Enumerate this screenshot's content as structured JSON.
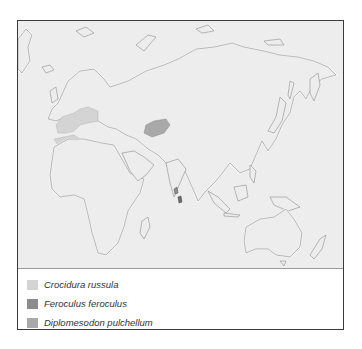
{
  "map": {
    "title": "",
    "region": "Eastern Hemisphere (Europe, Africa, Asia, Australia)",
    "ranges": [
      {
        "species": "Crocidura russula",
        "color": "#d4d4d4",
        "area": "Southwestern/central Europe, North Africa (Maghreb)"
      },
      {
        "species": "Feroculus feroculus",
        "color": "#8c8c8c",
        "area": "Sri Lanka and southern India"
      },
      {
        "species": "Diplomesodon pulchellum",
        "color": "#a9a9a9",
        "area": "Central Asian steppes/deserts east of the Caspian Sea"
      }
    ]
  },
  "legend": {
    "items": [
      {
        "label": "Crocidura russula",
        "color": "#d4d4d4"
      },
      {
        "label": "Feroculus feroculus",
        "color": "#8c8c8c"
      },
      {
        "label": "Diplomesodon pulchellum",
        "color": "#a9a9a9"
      }
    ]
  }
}
